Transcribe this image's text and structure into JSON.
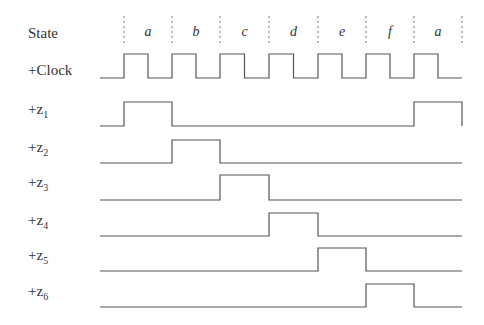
{
  "diagram": {
    "type": "timing-diagram",
    "row_labels": {
      "state": "State",
      "clock": "+Clock",
      "signals": [
        {
          "prefix": "+z",
          "sub": "1"
        },
        {
          "prefix": "+z",
          "sub": "2"
        },
        {
          "prefix": "+z",
          "sub": "3"
        },
        {
          "prefix": "+z",
          "sub": "4"
        },
        {
          "prefix": "+z",
          "sub": "5"
        },
        {
          "prefix": "+z",
          "sub": "6"
        }
      ]
    },
    "states": [
      "a",
      "b",
      "c",
      "d",
      "e",
      "f",
      "a"
    ],
    "boundaries_x": [
      124,
      172,
      220,
      269,
      318,
      366,
      414,
      462
    ],
    "clock": {
      "start_x": 100,
      "end_x": 462,
      "high_y": 54,
      "low_y": 78
    },
    "signals": [
      {
        "name": "z1",
        "low_y": 126,
        "high_y": 102,
        "high_intervals": [
          [
            0,
            1
          ],
          [
            6,
            7
          ]
        ]
      },
      {
        "name": "z2",
        "low_y": 163,
        "high_y": 140,
        "high_intervals": [
          [
            1,
            2
          ]
        ]
      },
      {
        "name": "z3",
        "low_y": 200,
        "high_y": 175,
        "high_intervals": [
          [
            2,
            3
          ]
        ]
      },
      {
        "name": "z4",
        "low_y": 236,
        "high_y": 213,
        "high_intervals": [
          [
            3,
            4
          ]
        ]
      },
      {
        "name": "z5",
        "low_y": 271,
        "high_y": 248,
        "high_intervals": [
          [
            4,
            5
          ]
        ]
      },
      {
        "name": "z6",
        "low_y": 307,
        "high_y": 284,
        "high_intervals": [
          [
            5,
            6
          ]
        ]
      }
    ],
    "line_color": "#555555"
  }
}
